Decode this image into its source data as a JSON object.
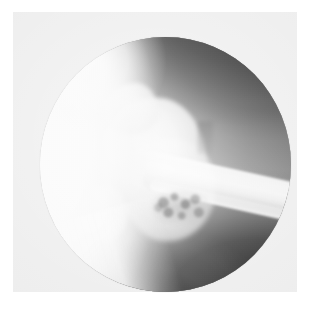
{
  "figure": {
    "kind": "radiograph",
    "modality_label": "fluoroscopic spot radiograph",
    "caption": "",
    "field_of_view_shape": "circular",
    "has_visible_text": false,
    "annotations": [],
    "labels": [],
    "scale_bar": null,
    "page_background_color": "#ffffff",
    "plate_color": "#ececec",
    "image_border_color": "#d8d8d8"
  },
  "radiograph": {
    "view_description": "lateral projection of a joint showing the articular head, metaphysis and diaphyseal shaft",
    "field": {
      "center_x_pct": 50,
      "center_y_pct": 50,
      "diameter_x_px": 251,
      "diameter_y_px": 255
    },
    "tone_range": {
      "darkest_hex": "#080808",
      "brightest_hex": "#ffffff",
      "midtone_hex": "#9e9e9e"
    },
    "regions": [
      {
        "name": "bright-lateral-soft-tissue",
        "description": "over-exposed blown-out white band along the left margin of the field",
        "position": "left",
        "tone": "white",
        "tone_hex": "#ffffff"
      },
      {
        "name": "dark-superior-band",
        "description": "dark curved band of air/soft tissue across the upper right quadrant",
        "position": "upper-right",
        "tone": "very dark",
        "tone_hex": "#0e0e0e"
      },
      {
        "name": "dark-inferior-region",
        "description": "large very dark area occupying the lower right of the field",
        "position": "lower-right",
        "tone": "very dark",
        "tone_hex": "#0a0a0a"
      },
      {
        "name": "articular-head",
        "description": "rounded dense bony epiphysis near the centre-left of the field",
        "position": "center-left",
        "tone": "bright",
        "tone_hex": "#f6f6f6"
      },
      {
        "name": "superior-tubercle",
        "description": "small bony prominence projecting superiorly from the head",
        "position": "upper-center-left",
        "tone": "bright",
        "tone_hex": "#f2f2f2"
      },
      {
        "name": "inferior-process",
        "description": "rounded bony process below and lateral to the head",
        "position": "lower-left",
        "tone": "bright",
        "tone_hex": "#f4f4f4"
      },
      {
        "name": "metaphysis-neck",
        "description": "broad bone segment bridging the head into the shaft",
        "position": "center",
        "tone": "light gray",
        "tone_hex": "#e4e4e4"
      },
      {
        "name": "diaphyseal-shaft",
        "description": "straight cortical bone shaft running diagonally to the right image margin at roughly 12 degrees below horizontal",
        "position": "center-right to right-edge",
        "tone": "bright with dense cortical margins",
        "tone_hex": "#fbfbfb"
      },
      {
        "name": "trabecular-mottling",
        "description": "speckled lucent/mottled texture within the bone just above the inferior dark region",
        "position": "center-lower",
        "tone": "mottled mid-gray",
        "tone_hex": "#5a5a5a"
      },
      {
        "name": "collimator-edge",
        "description": "straight bright collimation border truncating the lower-left arc of the circular field",
        "position": "lower-left",
        "tone": "white",
        "tone_hex": "#fdfdfd"
      },
      {
        "name": "cortical-notch",
        "description": "small dark step in the cortical outline at the superior head-shaft junction",
        "position": "upper-center-right",
        "tone": "dark gray",
        "tone_hex": "#3c3c3c"
      }
    ]
  }
}
